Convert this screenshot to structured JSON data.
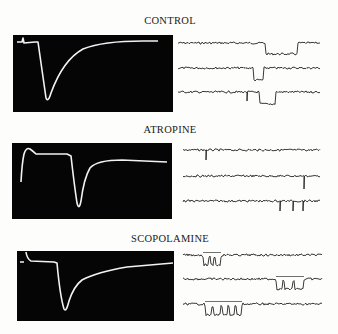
{
  "figure": {
    "sections": [
      {
        "label": "CONTROL",
        "label_pos": {
          "x": 75,
          "y": 15
        },
        "panel": {
          "x": 13,
          "y": 35,
          "w": 160,
          "h": 77
        },
        "oscilloscope_path": "M4,7 L9,7 L10,3 L11,8 L22,7 L25,7 L33,63 Q35,68 38,58 Q50,25 70,14 Q90,6 130,6 L145,6",
        "single_channel_rows": [
          {
            "y": 43,
            "x0": 178,
            "x1": 320,
            "events": [
              {
                "type": "step",
                "from": 266,
                "to": 297,
                "depth": 11
              }
            ]
          },
          {
            "y": 68,
            "x0": 178,
            "x1": 320,
            "events": [
              {
                "type": "step",
                "from": 254,
                "to": 263,
                "depth": 12
              }
            ]
          },
          {
            "y": 92,
            "x0": 178,
            "x1": 320,
            "events": [
              {
                "type": "spike",
                "at": 247,
                "depth": 9
              },
              {
                "type": "step",
                "from": 260,
                "to": 275,
                "depth": 12
              }
            ]
          }
        ]
      },
      {
        "label": "ATROPINE",
        "label_pos": {
          "x": 75,
          "y": 124
        },
        "panel": {
          "x": 12,
          "y": 143,
          "w": 160,
          "h": 76
        },
        "oscilloscope_path": "M9,39 Q10,20 12,11 Q14,4 18,6 Q22,9 24,11 L55,11 L59,13 Q62,40 65,60 Q67,68 69,58 Q72,35 78,25 Q85,17 110,17 L155,19",
        "single_channel_rows": [
          {
            "y": 150,
            "x0": 183,
            "x1": 320,
            "events": [
              {
                "type": "spike",
                "at": 206,
                "depth": 10
              }
            ]
          },
          {
            "y": 176,
            "x0": 183,
            "x1": 320,
            "events": [
              {
                "type": "spike",
                "at": 304,
                "depth": 13
              }
            ]
          },
          {
            "y": 201,
            "x0": 183,
            "x1": 320,
            "events": [
              {
                "type": "spike",
                "at": 280,
                "depth": 10
              },
              {
                "type": "spike",
                "at": 293,
                "depth": 10
              },
              {
                "type": "spike",
                "at": 303,
                "depth": 10
              }
            ]
          }
        ]
      },
      {
        "label": "SCOPOLAMINE",
        "label_pos": {
          "x": 75,
          "y": 233
        },
        "panel": {
          "x": 17,
          "y": 251,
          "w": 157,
          "h": 70
        },
        "oscilloscope_path": "M3,11 L7,11 M9,1 Q10,8 14,10 L37,11 L40,12 Q43,45 47,58 Q49,62 52,50 Q57,35 65,29 Q80,21 110,16 L156,12",
        "single_channel_rows": [
          {
            "y": 255,
            "x0": 183,
            "x1": 322,
            "events": [
              {
                "type": "burst",
                "from": 203,
                "to": 221,
                "depth": 10,
                "gaps": [
                  209,
                  214
                ]
              }
            ]
          },
          {
            "y": 279,
            "x0": 183,
            "x1": 322,
            "events": [
              {
                "type": "burst",
                "from": 276,
                "to": 304,
                "depth": 10,
                "gaps": [
                  283,
                  293
                ]
              }
            ]
          },
          {
            "y": 304,
            "x0": 183,
            "x1": 322,
            "events": [
              {
                "type": "burst",
                "from": 205,
                "to": 242,
                "depth": 11,
                "gaps": [
                  212,
                  221,
                  228,
                  235
                ]
              }
            ]
          }
        ]
      }
    ]
  }
}
